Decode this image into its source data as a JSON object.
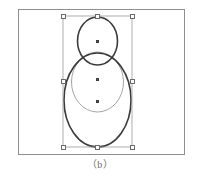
{
  "figure": {
    "caption": "（b）",
    "background_color": "#ffffff",
    "frame": {
      "x": 18,
      "y": 9,
      "width": 167,
      "height": 146,
      "stroke_color": "#8e8e8e",
      "stroke_width": 1
    }
  },
  "canvas": {
    "label": "vector-editor-canvas",
    "shapes": [
      {
        "name": "top-egg-ellipse",
        "type": "ellipse",
        "cx": 97.5,
        "cy": 41.0,
        "rx": 20.0,
        "ry": 24.0,
        "stroke_color": "#3a3a3a",
        "stroke_width": 1.6,
        "fill": "none"
      },
      {
        "name": "middle-circle",
        "type": "ellipse",
        "cx": 97.5,
        "cy": 82.0,
        "rx": 26.0,
        "ry": 30.0,
        "stroke_color": "#9a9a9a",
        "stroke_width": 0.9,
        "fill": "none"
      },
      {
        "name": "bottom-large-oval",
        "type": "ellipse",
        "cx": 97.5,
        "cy": 100.0,
        "rx": 33.5,
        "ry": 47.0,
        "stroke_color": "#3a3a3a",
        "stroke_width": 1.6,
        "fill": "none"
      }
    ]
  },
  "selection": {
    "label": "selection-bounding-box",
    "box": {
      "x": 63.0,
      "y": 16.0,
      "width": 69.0,
      "height": 131.0,
      "stroke_color": "#9a9a9a",
      "stroke_width": 0.8
    },
    "handle_fill": "#ffffff",
    "handle_stroke": "#6a6a6a",
    "handles": [
      {
        "name": "handle-top-left",
        "x": 63,
        "y": 16
      },
      {
        "name": "handle-top-center",
        "x": 97.5,
        "y": 16
      },
      {
        "name": "handle-top-right",
        "x": 132,
        "y": 16
      },
      {
        "name": "handle-middle-left",
        "x": 63,
        "y": 81.5
      },
      {
        "name": "handle-middle-right",
        "x": 132,
        "y": 81.5
      },
      {
        "name": "handle-bottom-left",
        "x": 63,
        "y": 147
      },
      {
        "name": "handle-bottom-center",
        "x": 97.5,
        "y": 147
      },
      {
        "name": "handle-bottom-right",
        "x": 132,
        "y": 147
      }
    ],
    "center_markers": [
      {
        "name": "center-dot-top-shape",
        "x": 97.5,
        "y": 41.5
      },
      {
        "name": "center-dot-middle-shape",
        "x": 97.5,
        "y": 79.5
      },
      {
        "name": "center-dot-bottom-shape",
        "x": 97.5,
        "y": 101.5
      }
    ]
  }
}
